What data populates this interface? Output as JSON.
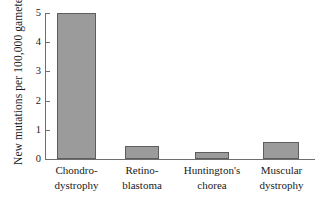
{
  "chart_data": {
    "type": "bar",
    "title": "",
    "subtitle": "",
    "xlabel": "",
    "ylabel": "New mutations per 100,000 gametes",
    "ylim": [
      0,
      5
    ],
    "yticks": [
      "0",
      "1",
      "2",
      "3",
      "4",
      "5"
    ],
    "grid": false,
    "legend": null,
    "categories": [
      "Chondro-dystrophy",
      "Retino-blastoma",
      "Huntington's chorea",
      "Muscular dystrophy"
    ],
    "category_lines": [
      [
        "Chondro-",
        "dystrophy"
      ],
      [
        "Retino-",
        "blastoma"
      ],
      [
        "Huntington's",
        "chorea"
      ],
      [
        "Muscular",
        "dystrophy"
      ]
    ],
    "values": [
      5.0,
      0.45,
      0.24,
      0.57
    ],
    "bar_color": "#9b9b9b",
    "bar_edge_color": "#5d5d5d",
    "axis_color": "#6e6e6e",
    "background_color": "#ffffff"
  }
}
